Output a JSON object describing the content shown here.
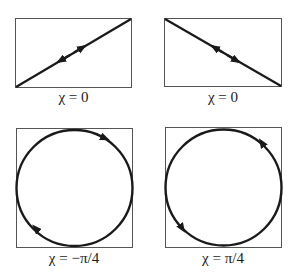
{
  "figure": {
    "panels": [
      {
        "id": "top-left",
        "label": "χ = 0",
        "shape": "line",
        "direction": "diagonal-up-right",
        "arrows": "bidirectional"
      },
      {
        "id": "top-right",
        "label": "χ = 0",
        "shape": "line",
        "direction": "diagonal-down-right",
        "arrows": "bidirectional"
      },
      {
        "id": "bottom-left",
        "label": "χ = −π/4",
        "shape": "circle",
        "rotation": "clockwise"
      },
      {
        "id": "bottom-right",
        "label": "χ = π/4",
        "shape": "circle",
        "rotation": "counterclockwise"
      }
    ],
    "colors": {
      "stroke": "#1a1a1a",
      "frame": "#555555",
      "background": "#ffffff"
    }
  }
}
